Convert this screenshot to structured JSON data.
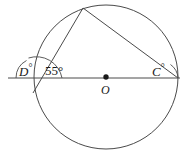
{
  "figure": {
    "background_color": "#ffffff",
    "stroke_color": "#3a3a3a",
    "center_point_color": "#1a1a1a",
    "width": 187,
    "height": 152
  },
  "labels": {
    "angle_d": "D",
    "angle_d_degree_symbol": "°",
    "angle_55": "55°",
    "angle_c": "C",
    "angle_c_degree_symbol": "°",
    "center": "O"
  },
  "geometry": {
    "circle": {
      "center_x": 106,
      "center_y": 77,
      "radius": 72
    },
    "center_dot": {
      "x": 106,
      "y": 77,
      "radius": 2.6
    },
    "secant_line": {
      "x1": 8,
      "y1": 78,
      "x2": 180,
      "y2": 78
    },
    "apex": {
      "x": 83,
      "y": 8
    },
    "left_intersection": {
      "x": 35,
      "y": 78
    },
    "right_intersection": {
      "x": 178,
      "y": 78
    },
    "chord_apex_to_left": {
      "x1": 83,
      "y1": 8,
      "x2": 33,
      "y2": 92
    },
    "chord_apex_to_right": {
      "x1": 83,
      "y1": 8,
      "x2": 178,
      "y2": 78
    },
    "arc_d_marker": {
      "radius": 20,
      "description": "arc from horizontal ray to chord at D"
    },
    "arc_55_marker": {
      "radius": 26,
      "description": "arc from chord to horizontal ray for 55 degrees"
    },
    "arc_c_marker": {
      "radius": 18,
      "description": "small arc at right intersection C"
    }
  }
}
